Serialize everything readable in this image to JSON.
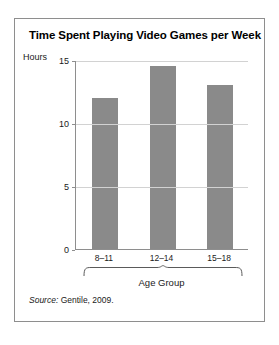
{
  "figure": {
    "title": "Time Spent Playing Video Games per Week",
    "source_prefix": "Source:",
    "source_text": "Gentile, 2009."
  },
  "chart_data": {
    "type": "bar",
    "title": "Time Spent Playing Video Games per Week",
    "categories": [
      "8–11",
      "12–14",
      "15–18"
    ],
    "values": [
      12,
      14.5,
      13
    ],
    "xlabel": "Age Group",
    "ylabel": "Hours",
    "ylim": [
      0,
      15
    ],
    "yticks": [
      0,
      5,
      10,
      15
    ],
    "ytick_labels": [
      "0",
      "5",
      "10",
      "15"
    ],
    "grid": true,
    "legend": "none",
    "bar_color": "#8a8a8a",
    "gridline_color": "#d2d2d2",
    "axis_color": "#8e8e8e"
  }
}
